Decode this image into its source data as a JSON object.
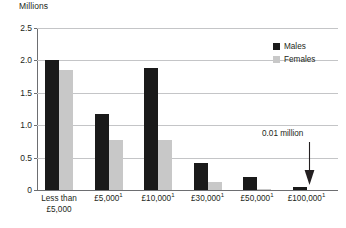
{
  "chart_data": {
    "type": "bar",
    "title": "",
    "subtitle": "",
    "xlabel": "",
    "ylabel": "Millions",
    "ylim": [
      0,
      2.5
    ],
    "yticks": [
      "0",
      "0.5",
      "1.0",
      "1.5",
      "2.0",
      "2.5"
    ],
    "ytick_values": [
      0,
      0.5,
      1.0,
      1.5,
      2.0,
      2.5
    ],
    "grid": true,
    "legend_position": "top-right",
    "categories": [
      "Less than £5,000",
      "£5,000¹",
      "£10,000¹",
      "£30,000¹",
      "£50,000¹",
      "£100,000¹"
    ],
    "category_lines": [
      [
        "Less than",
        "£5,000"
      ],
      [
        "£5,000",
        "1"
      ],
      [
        "£10,000",
        "1"
      ],
      [
        "£30,000",
        "1"
      ],
      [
        "£50,000",
        "1"
      ],
      [
        "£100,000",
        "1"
      ]
    ],
    "series": [
      {
        "name": "Males",
        "color": "#1a1a1a",
        "values": [
          2.0,
          1.17,
          1.88,
          0.42,
          0.2,
          0.05
        ]
      },
      {
        "name": "Females",
        "color": "#c8c8c8",
        "values": [
          1.85,
          0.77,
          0.77,
          0.12,
          0.02,
          0.0
        ]
      }
    ],
    "annotations": [
      {
        "text": "0.01 million",
        "target_category": "£100,000¹",
        "target_series": "Males"
      }
    ]
  },
  "axis": {
    "y_title": "Millions"
  },
  "legend": {
    "items": [
      {
        "label": "Males",
        "color": "#1a1a1a"
      },
      {
        "label": "Females",
        "color": "#c8c8c8"
      }
    ]
  },
  "annotation": {
    "label": "0.01 million"
  },
  "colors": {
    "males": "#1a1a1a",
    "females": "#c8c8c8",
    "axis": "#6d6e71",
    "grid": "#c4c5c7",
    "text": "#231f20",
    "background": "#ffffff"
  }
}
